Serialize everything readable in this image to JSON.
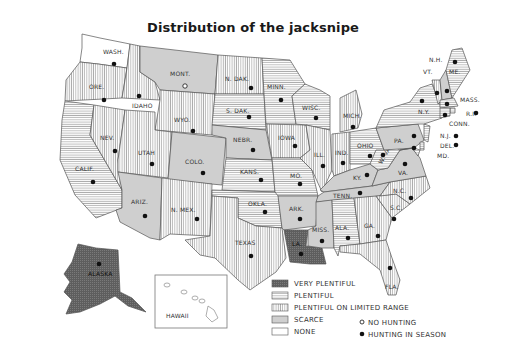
{
  "title": "Distribution of the jacksnipe",
  "legend": {
    "categories": [
      {
        "key": "very_plentiful",
        "label": "VERY PLENTIFUL",
        "fill": "#6b6b6b"
      },
      {
        "key": "plentiful",
        "label": "PLENTIFUL",
        "fill": "horizontal-hatch"
      },
      {
        "key": "limited",
        "label": "PLENTIFUL ON LIMITED RANGE",
        "fill": "vertical-hatch"
      },
      {
        "key": "scarce",
        "label": "SCARCE",
        "fill": "#cfcfcf"
      },
      {
        "key": "none",
        "label": "NONE",
        "fill": "#ffffff"
      }
    ],
    "markers": [
      {
        "key": "no_hunting",
        "label": "NO HUNTING",
        "symbol": "open-circle"
      },
      {
        "key": "hunting",
        "label": "HUNTING IN SEASON",
        "symbol": "filled-circle"
      }
    ]
  },
  "states": [
    {
      "abbr": "WASH.",
      "status": "none",
      "hunting": true
    },
    {
      "abbr": "ORE.",
      "status": "limited",
      "hunting": true
    },
    {
      "abbr": "CALIF.",
      "status": "plentiful",
      "hunting": true
    },
    {
      "abbr": "IDAHO",
      "status": "limited",
      "hunting": true
    },
    {
      "abbr": "NEV.",
      "status": "limited",
      "hunting": true
    },
    {
      "abbr": "MONT.",
      "status": "scarce",
      "hunting": false
    },
    {
      "abbr": "WYO.",
      "status": "limited",
      "hunting": true
    },
    {
      "abbr": "UTAH",
      "status": "limited",
      "hunting": true
    },
    {
      "abbr": "COLO.",
      "status": "scarce",
      "hunting": true
    },
    {
      "abbr": "ARIZ.",
      "status": "scarce",
      "hunting": true
    },
    {
      "abbr": "N. MEX.",
      "status": "limited",
      "hunting": true
    },
    {
      "abbr": "N. DAK.",
      "status": "limited",
      "hunting": true
    },
    {
      "abbr": "S. DAK.",
      "status": "plentiful",
      "hunting": true
    },
    {
      "abbr": "NEBR.",
      "status": "scarce",
      "hunting": true
    },
    {
      "abbr": "KANS.",
      "status": "plentiful",
      "hunting": true
    },
    {
      "abbr": "OKLA.",
      "status": "plentiful",
      "hunting": true
    },
    {
      "abbr": "TEXAS",
      "status": "limited",
      "hunting": true
    },
    {
      "abbr": "MINN.",
      "status": "plentiful",
      "hunting": true
    },
    {
      "abbr": "IOWA",
      "status": "limited",
      "hunting": true
    },
    {
      "abbr": "MO.",
      "status": "plentiful",
      "hunting": true
    },
    {
      "abbr": "ARK.",
      "status": "scarce",
      "hunting": true
    },
    {
      "abbr": "LA.",
      "status": "very_plentiful",
      "hunting": true
    },
    {
      "abbr": "WISC.",
      "status": "plentiful",
      "hunting": true
    },
    {
      "abbr": "ILL.",
      "status": "limited",
      "hunting": true
    },
    {
      "abbr": "MICH.",
      "status": "limited",
      "hunting": true
    },
    {
      "abbr": "IND.",
      "status": "limited",
      "hunting": true
    },
    {
      "abbr": "OHIO",
      "status": "plentiful",
      "hunting": true
    },
    {
      "abbr": "KY.",
      "status": "scarce",
      "hunting": true
    },
    {
      "abbr": "TENN.",
      "status": "scarce",
      "hunting": true
    },
    {
      "abbr": "MISS.",
      "status": "scarce",
      "hunting": true
    },
    {
      "abbr": "ALA.",
      "status": "plentiful",
      "hunting": true
    },
    {
      "abbr": "GA.",
      "status": "limited",
      "hunting": true
    },
    {
      "abbr": "FLA.",
      "status": "limited",
      "hunting": true
    },
    {
      "abbr": "S.C.",
      "status": "limited",
      "hunting": true
    },
    {
      "abbr": "N.C.",
      "status": "limited",
      "hunting": true
    },
    {
      "abbr": "VA.",
      "status": "scarce",
      "hunting": true
    },
    {
      "abbr": "W. VA.",
      "status": "plentiful",
      "hunting": true
    },
    {
      "abbr": "PA.",
      "status": "scarce",
      "hunting": true
    },
    {
      "abbr": "N.Y.",
      "status": "plentiful",
      "hunting": true
    },
    {
      "abbr": "VT.",
      "status": "limited",
      "hunting": true
    },
    {
      "abbr": "N.H.",
      "status": "scarce",
      "hunting": true
    },
    {
      "abbr": "ME.",
      "status": "plentiful",
      "hunting": true
    },
    {
      "abbr": "MASS.",
      "status": "plentiful",
      "hunting": true
    },
    {
      "abbr": "R.I.",
      "status": "plentiful",
      "hunting": true
    },
    {
      "abbr": "CONN.",
      "status": "plentiful",
      "hunting": true
    },
    {
      "abbr": "N.J.",
      "status": "plentiful",
      "hunting": true
    },
    {
      "abbr": "DEL.",
      "status": "plentiful",
      "hunting": true
    },
    {
      "abbr": "MD.",
      "status": "plentiful",
      "hunting": true
    },
    {
      "abbr": "ALASKA",
      "status": "very_plentiful",
      "hunting": true
    },
    {
      "abbr": "HAWAII",
      "status": "none",
      "hunting": null
    }
  ]
}
